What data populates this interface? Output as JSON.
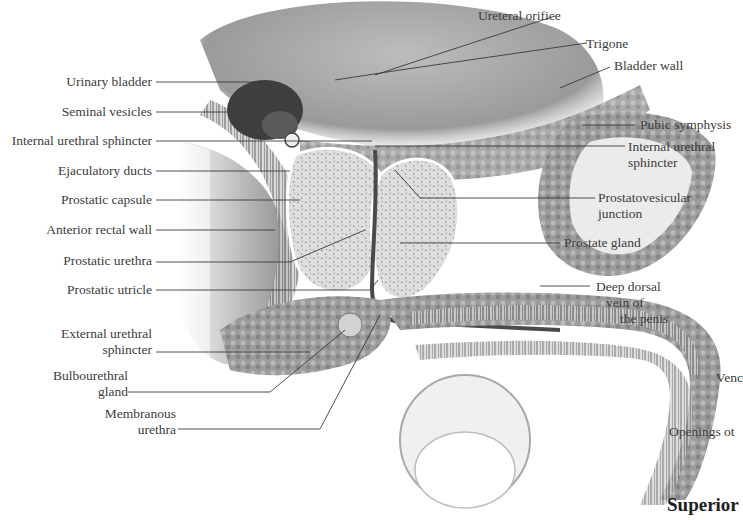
{
  "figure": {
    "type": "anatomical-illustration",
    "palette": {
      "ink": "#3c3c3c",
      "tissue_light": "#d9d9d9",
      "tissue_mid": "#a8a8a8",
      "tissue_dark": "#555555",
      "background": "#ffffff"
    }
  },
  "labels_left": [
    {
      "id": "urinary-bladder",
      "text": "Urinary bladder"
    },
    {
      "id": "seminal-vesicles",
      "text": "Seminal vesicles"
    },
    {
      "id": "internal-urethral-sphincter-left",
      "text": "Internal urethral sphincter"
    },
    {
      "id": "ejaculatory-ducts",
      "text": "Ejaculatory ducts"
    },
    {
      "id": "prostatic-capsule",
      "text": "Prostatic capsule"
    },
    {
      "id": "anterior-rectal-wall",
      "text": "Anterior rectal wall"
    },
    {
      "id": "prostatic-urethra",
      "text": "Prostatic urethra"
    },
    {
      "id": "prostatic-utricle",
      "text": "Prostatic utricle"
    },
    {
      "id": "external-urethral-sphincter",
      "line1": "External urethral",
      "line2": "sphincter"
    },
    {
      "id": "bulbourethral-gland",
      "line1": "Bulbourethral",
      "line2": "gland"
    },
    {
      "id": "membranous-urethra",
      "line1": "Membranous",
      "line2": "urethra"
    }
  ],
  "labels_right": [
    {
      "id": "ureteral-orifice",
      "text": "Ureteral orifice"
    },
    {
      "id": "trigone",
      "text": "Trigone"
    },
    {
      "id": "bladder-wall",
      "text": "Bladder wall"
    },
    {
      "id": "pubic-symphysis",
      "text": "Pubic symphysis"
    },
    {
      "id": "internal-urethral-sphincter-right",
      "line1": "Internal urethral",
      "line2": "sphincter"
    },
    {
      "id": "prostatovesicular-junction",
      "line1": "Prostatovesicular",
      "line2": "junction"
    },
    {
      "id": "prostate-gland",
      "text": "Prostate gland"
    },
    {
      "id": "deep-dorsal-vein",
      "line1": "Deep dorsal",
      "line2": "vein of",
      "line3": "the penis"
    }
  ],
  "cropped_fragments": {
    "fragment_1": "Venc",
    "fragment_2": "Openings ot",
    "heading_fragment": "Superior"
  }
}
